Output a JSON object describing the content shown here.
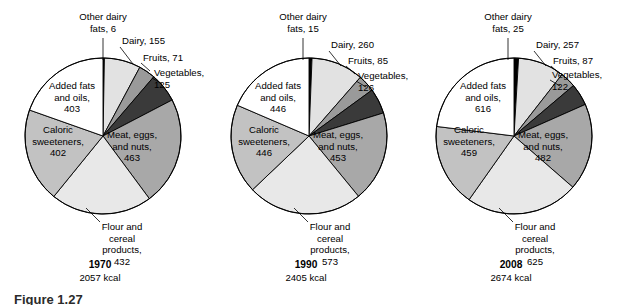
{
  "figure": {
    "caption_partial": "Figure  1.27",
    "background": "#ffffff"
  },
  "palette": {
    "other_dairy_fats": "#000000",
    "dairy": "#e2e2e2",
    "fruits": "#9a9a9a",
    "vegetables": "#3a3a3a",
    "meat_eggs_nuts": "#a8a8a8",
    "flour_cereal": "#e8e8e8",
    "caloric_sweeteners": "#c2c2c2",
    "added_fats_oils": "#ffffff",
    "outline": "#000000"
  },
  "chart_data": [
    {
      "type": "pie",
      "title": "1970",
      "subtitle": "2057 kcal",
      "total_kcal": 2057,
      "unit": "kcal",
      "categories": [
        "Other dairy fats",
        "Dairy",
        "Fruits",
        "Vegetables",
        "Meat, eggs, and nuts",
        "Flour and cereal products",
        "Caloric sweeteners",
        "Added fats and oils"
      ],
      "values": [
        6,
        155,
        71,
        125,
        463,
        432,
        402,
        403
      ],
      "labels": [
        {
          "key": "other_dairy_fats",
          "line1": "Other dairy",
          "line2": "fats, 6",
          "value": 6,
          "placement": "outside"
        },
        {
          "key": "dairy",
          "line1": "Dairy, 155",
          "value": 155,
          "placement": "outside"
        },
        {
          "key": "fruits",
          "line1": "Fruits, 71",
          "value": 71,
          "placement": "outside"
        },
        {
          "key": "vegetables",
          "line1": "Vegetables,",
          "line2": "125",
          "value": 125,
          "placement": "outside"
        },
        {
          "key": "meat_eggs_nuts",
          "line1": "Meat, eggs,",
          "line2": "and nuts,",
          "line3": "463",
          "value": 463,
          "placement": "inside"
        },
        {
          "key": "flour_cereal",
          "line1": "Flour and",
          "line2": "cereal",
          "line3": "products,",
          "line4": "432",
          "value": 432,
          "placement": "outside"
        },
        {
          "key": "caloric_sweeteners",
          "line1": "Caloric",
          "line2": "sweeteners,",
          "line3": "402",
          "value": 402,
          "placement": "inside"
        },
        {
          "key": "added_fats_oils",
          "line1": "Added fats",
          "line2": "and oils,",
          "line3": "403",
          "value": 403,
          "placement": "inside"
        }
      ]
    },
    {
      "type": "pie",
      "title": "1990",
      "subtitle": "2405 kcal",
      "total_kcal": 2405,
      "unit": "kcal",
      "categories": [
        "Other dairy fats",
        "Dairy",
        "Fruits",
        "Vegetables",
        "Meat, eggs, and nuts",
        "Flour and cereal products",
        "Caloric sweeteners",
        "Added fats and oils"
      ],
      "values": [
        15,
        260,
        85,
        126,
        453,
        573,
        446,
        446
      ],
      "labels": [
        {
          "key": "other_dairy_fats",
          "line1": "Other dairy",
          "line2": "fats, 15",
          "value": 15,
          "placement": "outside"
        },
        {
          "key": "dairy",
          "line1": "Dairy, 260",
          "value": 260,
          "placement": "outside"
        },
        {
          "key": "fruits",
          "line1": "Fruits,  85",
          "value": 85,
          "placement": "outside"
        },
        {
          "key": "vegetables",
          "line1": "Vegetables,",
          "line2": "126",
          "value": 126,
          "placement": "outside"
        },
        {
          "key": "meat_eggs_nuts",
          "line1": "Meat, eggs,",
          "line2": "and nuts,",
          "line3": "453",
          "value": 453,
          "placement": "inside"
        },
        {
          "key": "flour_cereal",
          "line1": "Flour and",
          "line2": "cereal",
          "line3": "products,",
          "line4": "573",
          "value": 573,
          "placement": "outside"
        },
        {
          "key": "caloric_sweeteners",
          "line1": "Caloric",
          "line2": "sweeteners,",
          "line3": "446",
          "value": 446,
          "placement": "inside"
        },
        {
          "key": "added_fats_oils",
          "line1": "Added fats",
          "line2": "and oils,",
          "line3": "446",
          "value": 446,
          "placement": "inside"
        }
      ]
    },
    {
      "type": "pie",
      "title": "2008",
      "subtitle": "2674 kcal",
      "total_kcal": 2674,
      "unit": "kcal",
      "categories": [
        "Other dairy fats",
        "Dairy",
        "Fruits",
        "Vegetables",
        "Meat, eggs, and nuts",
        "Flour and cereal products",
        "Caloric sweeteners",
        "Added fats and oils"
      ],
      "values": [
        25,
        257,
        87,
        122,
        482,
        625,
        459,
        616
      ],
      "labels": [
        {
          "key": "other_dairy_fats",
          "line1": "Other dairy",
          "line2": "fats, 25",
          "value": 25,
          "placement": "outside"
        },
        {
          "key": "dairy",
          "line1": "Dairy, 257",
          "value": 257,
          "placement": "outside"
        },
        {
          "key": "fruits",
          "line1": "Fruits, 87",
          "value": 87,
          "placement": "outside"
        },
        {
          "key": "vegetables",
          "line1": "Vegetables,",
          "line2": "122",
          "value": 122,
          "placement": "outside"
        },
        {
          "key": "meat_eggs_nuts",
          "line1": "Meat, eggs,",
          "line2": "and nuts,",
          "line3": "482",
          "value": 482,
          "placement": "inside"
        },
        {
          "key": "flour_cereal",
          "line1": "Flour and",
          "line2": "cereal",
          "line3": "products,",
          "line4": "625",
          "value": 625,
          "placement": "outside"
        },
        {
          "key": "caloric_sweeteners",
          "line1": "Caloric",
          "line2": "sweeteners,",
          "line3": "459",
          "value": 459,
          "placement": "inside"
        },
        {
          "key": "added_fats_oils",
          "line1": "Added fats",
          "line2": "and oils,",
          "line3": "616",
          "value": 616,
          "placement": "inside"
        }
      ]
    }
  ]
}
